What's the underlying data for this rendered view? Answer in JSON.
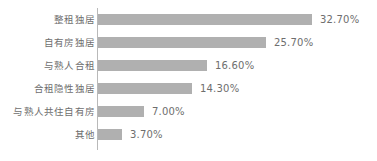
{
  "chart_data": {
    "type": "bar",
    "orientation": "horizontal",
    "title": "",
    "subtitle": "",
    "xlabel": "",
    "ylabel": "",
    "grid": false,
    "legend": null,
    "legend_position": "none",
    "xlim": [
      0,
      35
    ],
    "categories": [
      "整租独居",
      "自有房独居",
      "与熟人合租",
      "合租隐性独居",
      "与熟人共住自有房",
      "其他"
    ],
    "values": [
      32.7,
      25.7,
      16.6,
      14.3,
      7.0,
      3.7
    ],
    "value_labels": [
      "32.70%",
      "25.70%",
      "16.60%",
      "14.30%",
      "7.00%",
      "3.70%"
    ],
    "bar_color": "#b0b0b0",
    "axis_color": "#b9b9b9",
    "text_color": "#6e6e6e",
    "background": "#ffffff"
  }
}
